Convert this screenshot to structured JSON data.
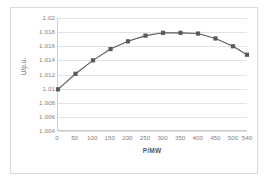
{
  "chart_data": {
    "type": "line",
    "title": "",
    "xlabel": "P/MW",
    "ylabel": "U/p.u.",
    "x": [
      0,
      50,
      100,
      150,
      200,
      250,
      300,
      350,
      400,
      450,
      500,
      540
    ],
    "values": [
      1.0099,
      1.0121,
      1.014,
      1.0156,
      1.0167,
      1.0175,
      1.0179,
      1.0179,
      1.0178,
      1.0171,
      1.016,
      1.0148
    ],
    "series": [
      {
        "name": "U/p.u.",
        "values": [
          1.0099,
          1.0121,
          1.014,
          1.0156,
          1.0167,
          1.0175,
          1.0179,
          1.0179,
          1.0178,
          1.0171,
          1.016,
          1.0148
        ]
      }
    ],
    "categories": [
      "0",
      "50",
      "100",
      "150",
      "200",
      "250",
      "300",
      "350",
      "400",
      "450",
      "500",
      "540"
    ],
    "xtick_labels": [
      "0",
      "50",
      "100",
      "150",
      "200",
      "250",
      "300",
      "350",
      "400",
      "450",
      "500",
      "540"
    ],
    "ytick_labels": [
      "1.02",
      "1.018",
      "1.016",
      "1.014",
      "1.012",
      "1.01",
      "1.008",
      "1.006",
      "1.004"
    ],
    "ytick_values": [
      1.02,
      1.018,
      1.016,
      1.014,
      1.012,
      1.01,
      1.008,
      1.006,
      1.004
    ],
    "ylim": [
      1.004,
      1.02
    ],
    "xlim": [
      0,
      540
    ],
    "grid": "horizontal",
    "legend": "none",
    "marker": "square",
    "series_color": "#595959",
    "gridline_color": "#e2e2e2",
    "tick_label_color": "#7f7f7f",
    "axis_title_color": "#595959",
    "background_color": "#ffffff",
    "border_color": "#d9d9d9"
  }
}
